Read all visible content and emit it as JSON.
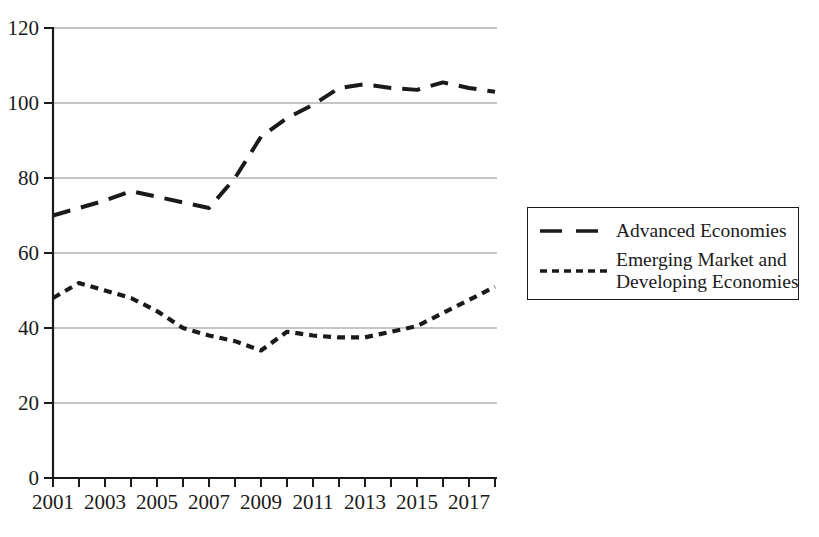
{
  "chart_data": {
    "type": "line",
    "title": "",
    "subtitle": "",
    "xlabel": "",
    "ylabel": "",
    "x": [
      2001,
      2002,
      2003,
      2004,
      2005,
      2006,
      2007,
      2008,
      2009,
      2010,
      2011,
      2012,
      2013,
      2014,
      2015,
      2016,
      2017,
      2018
    ],
    "xlim": [
      2001,
      2018
    ],
    "ylim": [
      0,
      120
    ],
    "y_ticks": [
      0,
      20,
      40,
      60,
      80,
      100,
      120
    ],
    "y_tick_labels": [
      "0",
      "20",
      "40",
      "60",
      "80",
      "100",
      "120"
    ],
    "x_ticks": [
      2001,
      2002,
      2003,
      2004,
      2005,
      2006,
      2007,
      2008,
      2009,
      2010,
      2011,
      2012,
      2013,
      2014,
      2015,
      2016,
      2017,
      2018
    ],
    "x_tick_labels": [
      "2001",
      "",
      "2003",
      "",
      "2005",
      "",
      "2007",
      "",
      "2009",
      "",
      "2011",
      "",
      "2013",
      "",
      "2015",
      "",
      "2017",
      ""
    ],
    "x_tick_labels_shown": [
      "2001",
      "2003",
      "2005",
      "2007",
      "2009",
      "2011",
      "2013",
      "2015",
      "2017"
    ],
    "grid": true,
    "grid_axis": "y",
    "legend_position": "right",
    "series": [
      {
        "name": "Advanced Economies",
        "dash": "long-dash",
        "color": "#1a1a1a",
        "values": [
          70,
          72,
          74,
          76.5,
          75,
          73.5,
          72,
          80,
          91,
          96,
          99.5,
          104,
          105,
          104,
          103.5,
          105.5,
          104,
          103
        ]
      },
      {
        "name": "Emerging Market and Developing Economies",
        "dash": "short-dash",
        "color": "#1a1a1a",
        "values": [
          48,
          52,
          50,
          48,
          44.5,
          40,
          38,
          36.5,
          34,
          39,
          38,
          37.5,
          37.5,
          39,
          40.5,
          44,
          47.5,
          51
        ]
      }
    ]
  },
  "legend": {
    "items": [
      {
        "label": "Advanced Economies",
        "label_line1": "Advanced Economies",
        "label_line2": ""
      },
      {
        "label": "Emerging Market and Developing Economies",
        "label_line1": "Emerging Market and",
        "label_line2": "Developing Economies"
      }
    ]
  },
  "colors": {
    "ink": "#1a1a1a",
    "grid": "#8c8c8c",
    "background": "#ffffff"
  }
}
